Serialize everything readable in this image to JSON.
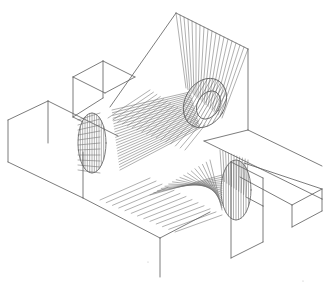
{
  "figure": {
    "width": 334,
    "height": 289,
    "background": "#ffffff",
    "stroke": "#5a5a5a",
    "hatch_stroke": "#6e6e6e",
    "stroke_width": 0.8,
    "hatch_width": 0.55
  },
  "boxes": [
    {
      "name": "box-left-long",
      "pts": [
        [
          8,
          120
        ],
        [
          48,
          101
        ],
        [
          48,
          143
        ],
        [
          8,
          162
        ]
      ],
      "edges": [
        [
          [
            8,
            120
          ],
          [
            48,
            101
          ]
        ],
        [
          [
            48,
            101
          ],
          [
            118,
            136
          ]
        ],
        [
          [
            8,
            120
          ],
          [
            8,
            162
          ]
        ],
        [
          [
            8,
            162
          ],
          [
            83,
            198
          ]
        ],
        [
          [
            48,
            101
          ],
          [
            48,
            143
          ]
        ]
      ]
    },
    {
      "name": "box-top-left",
      "pts": [
        [
          73,
          77
        ],
        [
          103,
          61
        ],
        [
          135,
          77
        ]
      ],
      "edges": [
        [
          [
            73,
            77
          ],
          [
            103,
            61
          ]
        ],
        [
          [
            103,
            61
          ],
          [
            135,
            77
          ]
        ],
        [
          [
            73,
            77
          ],
          [
            73,
            117
          ]
        ],
        [
          [
            103,
            61
          ],
          [
            103,
            98
          ]
        ],
        [
          [
            73,
            117
          ],
          [
            83,
            122
          ]
        ],
        [
          [
            103,
            98
          ],
          [
            73,
            117
          ]
        ],
        [
          [
            135,
            77
          ],
          [
            105,
            93
          ]
        ],
        [
          [
            73,
            77
          ],
          [
            105,
            93
          ]
        ]
      ]
    },
    {
      "name": "box-bottom-mid",
      "edges": [
        [
          [
            83,
            198
          ],
          [
            83,
            152
          ]
        ],
        [
          [
            83,
            198
          ],
          [
            160,
            238
          ]
        ],
        [
          [
            160,
            238
          ],
          [
            210,
            212
          ]
        ],
        [
          [
            160,
            238
          ],
          [
            160,
            277
          ]
        ]
      ]
    },
    {
      "name": "box-bottom-right",
      "edges": [
        [
          [
            231,
            162
          ],
          [
            231,
            258
          ]
        ],
        [
          [
            231,
            258
          ],
          [
            263,
            242
          ]
        ],
        [
          [
            263,
            242
          ],
          [
            263,
            206
          ]
        ],
        [
          [
            263,
            206
          ],
          [
            246,
            197
          ]
        ],
        [
          [
            231,
            162
          ],
          [
            263,
            178
          ]
        ],
        [
          [
            263,
            178
          ],
          [
            263,
            206
          ]
        ]
      ]
    },
    {
      "name": "box-right-long",
      "edges": [
        [
          [
            204,
            141
          ],
          [
            322,
            199
          ]
        ],
        [
          [
            240,
            177
          ],
          [
            292,
            205
          ]
        ],
        [
          [
            292,
            205
          ],
          [
            292,
            227
          ]
        ],
        [
          [
            292,
            227
          ],
          [
            322,
            211
          ]
        ],
        [
          [
            322,
            211
          ],
          [
            322,
            199
          ]
        ],
        [
          [
            292,
            205
          ],
          [
            322,
            189
          ]
        ],
        [
          [
            322,
            189
          ],
          [
            322,
            199
          ]
        ],
        [
          [
            244,
            163
          ],
          [
            322,
            189
          ]
        ]
      ]
    },
    {
      "name": "top-plane",
      "edges": [
        [
          [
            176,
            13
          ],
          [
            248,
            49
          ]
        ],
        [
          [
            248,
            49
          ],
          [
            248,
            130
          ]
        ],
        [
          [
            176,
            13
          ],
          [
            110,
            107
          ]
        ],
        [
          [
            248,
            130
          ],
          [
            204,
            141
          ]
        ],
        [
          [
            248,
            130
          ],
          [
            322,
            166
          ]
        ]
      ]
    }
  ],
  "cylinders": [
    {
      "name": "cylinder-top",
      "cx": 205,
      "cy": 103,
      "rx": 20,
      "ry": 26,
      "rot": 30,
      "inner_rx": 11,
      "inner_ry": 15
    },
    {
      "name": "cylinder-left",
      "cx": 92,
      "cy": 143,
      "rx": 14,
      "ry": 30,
      "rot": 0
    },
    {
      "name": "cylinder-right",
      "cx": 236,
      "cy": 190,
      "rx": 15,
      "ry": 30,
      "rot": 0
    }
  ],
  "fans": [
    {
      "name": "fan-top",
      "from": [
        [
          176,
          13
        ],
        [
          248,
          49
        ]
      ],
      "to": [
        [
          186,
          88
        ],
        [
          222,
          118
        ]
      ],
      "count": 18
    },
    {
      "name": "fan-center",
      "from": [
        [
          112,
          110
        ],
        [
          120,
          170
        ]
      ],
      "to": [
        [
          190,
          92
        ],
        [
          200,
          128
        ]
      ],
      "count": 22
    },
    {
      "name": "fan-center-cross",
      "from": [
        [
          108,
          118
        ],
        [
          185,
          150
        ]
      ],
      "to": [
        [
          150,
          90
        ],
        [
          205,
          125
        ]
      ],
      "count": 16
    },
    {
      "name": "fan-left",
      "from": [
        [
          78,
          120
        ],
        [
          78,
          170
        ]
      ],
      "to": [
        [
          100,
          113
        ],
        [
          100,
          173
        ]
      ],
      "count": 10
    },
    {
      "name": "fan-bottom-right",
      "from": [
        [
          150,
          195
        ],
        [
          210,
          160
        ]
      ],
      "to": [
        [
          222,
          175
        ],
        [
          222,
          210
        ]
      ],
      "count": 16
    },
    {
      "name": "fan-bottom-arc",
      "from": [
        [
          220,
          150
        ],
        [
          248,
          160
        ]
      ],
      "to": [
        [
          222,
          180
        ],
        [
          246,
          196
        ]
      ],
      "count": 10
    },
    {
      "name": "fan-under",
      "from": [
        [
          100,
          200
        ],
        [
          175,
          232
        ]
      ],
      "to": [
        [
          150,
          178
        ],
        [
          222,
          215
        ]
      ],
      "count": 12
    }
  ],
  "specks": [
    [
      148,
      262
    ],
    [
      303,
      281
    ]
  ]
}
